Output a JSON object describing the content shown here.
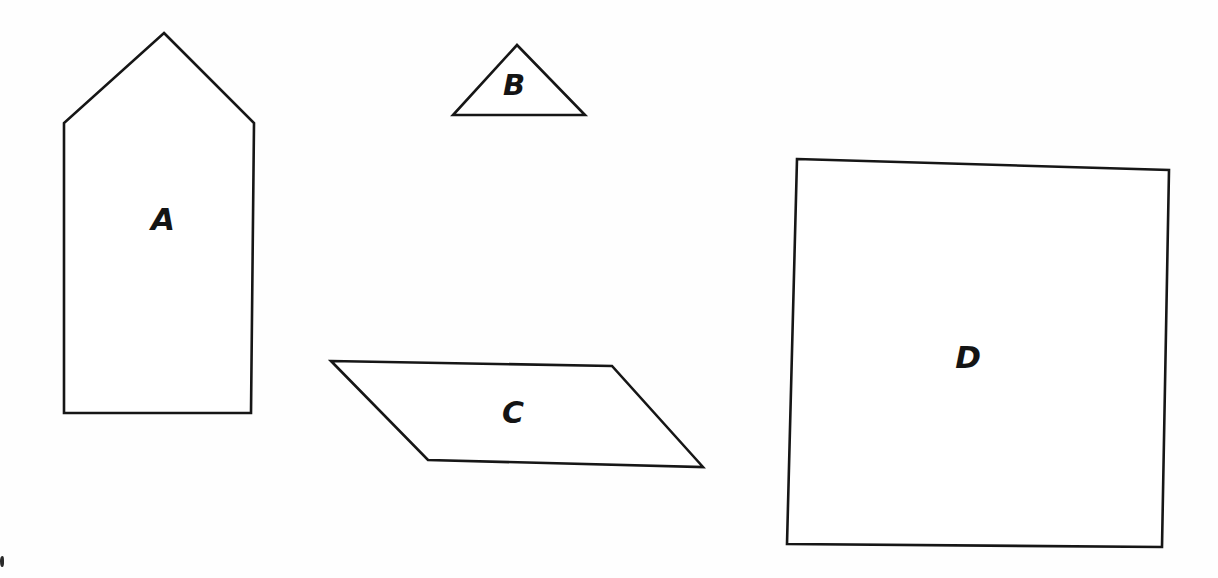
{
  "page": {
    "background_color": "#ffffff",
    "ink_color": "#161616",
    "width": 1218,
    "height": 578,
    "style": "hand-drawn line drawing, scanned page"
  },
  "figure": {
    "shape_count": 4,
    "shapes": [
      {
        "id": "A",
        "label": "A",
        "name": "pentagon-house",
        "description": "house-shaped pentagon with pointed roof",
        "points": "164,33 254,123 251,413 64,413 64,123",
        "label_x": 163,
        "label_y": 221
      },
      {
        "id": "B",
        "label": "B",
        "name": "triangle",
        "description": "small wide triangle",
        "points": "517,45 585,115 453,115",
        "label_x": 514,
        "label_y": 87
      },
      {
        "id": "C",
        "label": "C",
        "name": "parallelogram",
        "description": "slanted parallelogram leaning right",
        "points": "331,361 612,366 703,467 428,460",
        "label_x": 513,
        "label_y": 414
      },
      {
        "id": "D",
        "label": "D",
        "name": "square",
        "description": "large slightly tilted square",
        "points": "797,159 1169,170 1162,547 787,544",
        "label_x": 968,
        "label_y": 359
      }
    ]
  },
  "artifacts": {
    "bottom_left_mark": "scan edge mark"
  }
}
